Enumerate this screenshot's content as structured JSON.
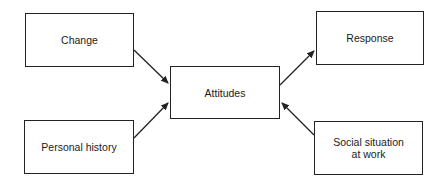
{
  "diagram": {
    "nodes": {
      "change": {
        "label": "Change"
      },
      "personal_history": {
        "label": "Personal history"
      },
      "attitudes": {
        "label": "Attitudes"
      },
      "response": {
        "label": "Response"
      },
      "social_situation": {
        "label_line1": "Social situation",
        "label_line2": "at work"
      }
    },
    "edges": [
      {
        "from": "Change",
        "to": "Attitudes"
      },
      {
        "from": "Personal history",
        "to": "Attitudes"
      },
      {
        "from": "Attitudes",
        "to": "Response"
      },
      {
        "from": "Social situation at work",
        "to": "Attitudes"
      }
    ],
    "colors": {
      "stroke": "#222222",
      "background": "#ffffff"
    }
  }
}
